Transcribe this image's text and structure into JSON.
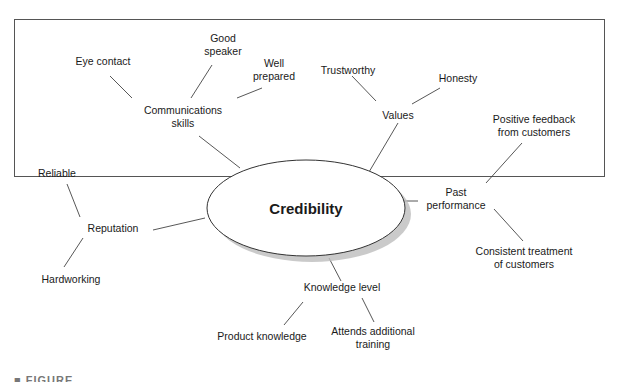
{
  "diagram": {
    "center": {
      "label": "Credibility"
    },
    "branches": [
      {
        "label": "Communications skills",
        "lines": [
          "Communications",
          "skills"
        ],
        "children": [
          "Eye contact",
          "Good speaker",
          "Well prepared"
        ]
      },
      {
        "label": "Values",
        "lines": [
          "Values"
        ],
        "children": [
          "Trustworthy",
          "Honesty"
        ]
      },
      {
        "label": "Past performance",
        "lines": [
          "Past",
          "performance"
        ],
        "children": [
          "Positive feedback from customers",
          "Consistent treatment of customers"
        ]
      },
      {
        "label": "Knowledge level",
        "lines": [
          "Knowledge level"
        ],
        "children": [
          "Product knowledge",
          "Attends additional training"
        ]
      },
      {
        "label": "Reputation",
        "lines": [
          "Reputation"
        ],
        "children": [
          "Reliable",
          "Hardworking"
        ]
      }
    ],
    "text": {
      "eye_contact": "Eye contact",
      "good_speaker_1": "Good",
      "good_speaker_2": "speaker",
      "well_prepared_1": "Well",
      "well_prepared_2": "prepared",
      "comm_1": "Communications",
      "comm_2": "skills",
      "trustworthy": "Trustworthy",
      "honesty": "Honesty",
      "values": "Values",
      "positive_1": "Positive feedback",
      "positive_2": "from customers",
      "past_1": "Past",
      "past_2": "performance",
      "consistent_1": "Consistent treatment",
      "consistent_2": "of customers",
      "knowledge": "Knowledge level",
      "product": "Product knowledge",
      "attends_1": "Attends additional",
      "attends_2": "training",
      "reputation": "Reputation",
      "reliable": "Reliable",
      "hardworking": "Hardworking",
      "center": "Credibility"
    },
    "caption": "■ FIGURE"
  }
}
